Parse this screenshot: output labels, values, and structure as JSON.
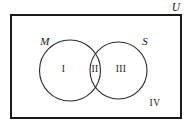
{
  "figure": {
    "type": "venn-diagram",
    "sets_count": 2,
    "regions_count": 4
  },
  "universe": {
    "label": "U",
    "shape": "rectangle",
    "label_position": "outside-top-right"
  },
  "sets": [
    {
      "id": "M",
      "label": "M",
      "label_position": "outside-upper-left",
      "shape": "circle"
    },
    {
      "id": "S",
      "label": "S",
      "label_position": "outside-upper-right",
      "shape": "circle"
    }
  ],
  "regions": [
    {
      "id": "I",
      "label": "I",
      "meaning": "M only"
    },
    {
      "id": "II",
      "label": "II",
      "meaning": "M and S"
    },
    {
      "id": "III",
      "label": "III",
      "meaning": "S only"
    },
    {
      "id": "IV",
      "label": "IV",
      "meaning": "neither M nor S"
    }
  ],
  "colors": {
    "background": "#ffffff",
    "stroke": "#1a1a1a",
    "circle_stroke": "#2b2b2b",
    "text": "#171717",
    "fill": "none"
  },
  "geometry": {
    "rectangle": {
      "x": 11,
      "y": 15,
      "width": 170,
      "height": 103,
      "stroke_width": 2
    },
    "circle_left": {
      "cx": 70,
      "cy": 70.5,
      "r": 30.5,
      "stroke_width": 1.1
    },
    "circle_right": {
      "cx": 118.5,
      "cy": 70.5,
      "r": 28.5,
      "stroke_width": 1.1
    }
  }
}
